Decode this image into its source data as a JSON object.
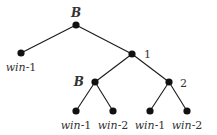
{
  "diagram": {
    "type": "game-tree",
    "nodes": [
      {
        "id": "root",
        "label": "B",
        "x": 76,
        "y": 25
      },
      {
        "id": "leaf-left",
        "label": "win-1",
        "x": 21,
        "y": 53
      },
      {
        "id": "n1",
        "label": "1",
        "x": 132,
        "y": 54
      },
      {
        "id": "nB",
        "label": "B",
        "x": 95,
        "y": 82
      },
      {
        "id": "n2",
        "label": "2",
        "x": 169,
        "y": 82
      },
      {
        "id": "leaf-b1",
        "label": "win-1",
        "x": 76,
        "y": 111
      },
      {
        "id": "leaf-b2",
        "label": "win-2",
        "x": 113,
        "y": 111
      },
      {
        "id": "leaf-21",
        "label": "win-1",
        "x": 150,
        "y": 111
      },
      {
        "id": "leaf-22",
        "label": "win-2",
        "x": 187,
        "y": 111
      }
    ],
    "edges": [
      [
        "root",
        "leaf-left"
      ],
      [
        "root",
        "n1"
      ],
      [
        "n1",
        "nB"
      ],
      [
        "n1",
        "n2"
      ],
      [
        "nB",
        "leaf-b1"
      ],
      [
        "nB",
        "leaf-b2"
      ],
      [
        "n2",
        "leaf-21"
      ],
      [
        "n2",
        "leaf-22"
      ]
    ],
    "labels": {
      "root": "B",
      "n1": "1",
      "nB": "B",
      "n2": "2",
      "leaf_left": {
        "word": "win",
        "num": "-1"
      },
      "leaf_b1": {
        "word": "win",
        "num": "-1"
      },
      "leaf_b2": {
        "word": "win",
        "num": "-2"
      },
      "leaf_21": {
        "word": "win",
        "num": "-1"
      },
      "leaf_22": {
        "word": "win",
        "num": "-2"
      }
    }
  }
}
